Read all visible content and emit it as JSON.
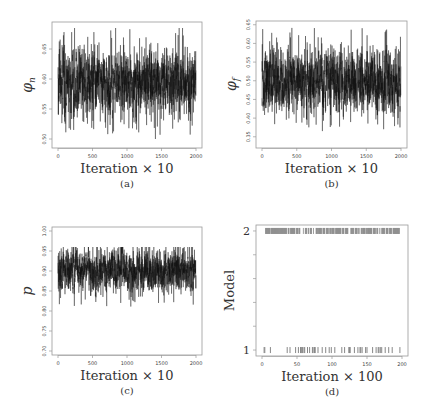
{
  "chart_data": [
    {
      "id": "a",
      "type": "line",
      "title": "",
      "caption": "(a)",
      "xlabel": "Iteration × 10",
      "ylabel": "φ_n",
      "ylabel_main": "φ",
      "ylabel_sub": "n",
      "xlim": [
        0,
        2000
      ],
      "ylim": [
        0.485,
        0.695
      ],
      "xticks": [
        0,
        500,
        1000,
        1500,
        2000
      ],
      "xtick_labels": [
        "0",
        "500",
        "1000",
        "1500",
        "2000"
      ],
      "yticks": [
        0.5,
        0.55,
        0.6,
        0.65
      ],
      "ytick_labels": [
        "0.50",
        "0.55",
        "0.60",
        "0.65"
      ],
      "series": [
        {
          "name": "phi_n trace",
          "mean": 0.595,
          "sd": 0.025,
          "min": 0.5,
          "max": 0.685,
          "n": 2000
        }
      ],
      "grid": false,
      "box": {
        "x": 52,
        "y": 22,
        "w": 150,
        "h": 126
      }
    },
    {
      "id": "b",
      "type": "line",
      "title": "",
      "caption": "(b)",
      "xlabel": "Iteration × 10",
      "ylabel": "φ_f",
      "ylabel_main": "φ",
      "ylabel_sub": "f",
      "xlim": [
        0,
        2000
      ],
      "ylim": [
        0.32,
        0.66
      ],
      "xticks": [
        0,
        500,
        1000,
        1500,
        2000
      ],
      "xtick_labels": [
        "0",
        "500",
        "1000",
        "1500",
        "2000"
      ],
      "yticks": [
        0.35,
        0.4,
        0.45,
        0.5,
        0.55,
        0.6,
        0.65
      ],
      "ytick_labels": [
        "0.35",
        "0.40",
        "0.45",
        "0.50",
        "0.55",
        "0.60",
        "0.65"
      ],
      "series": [
        {
          "name": "phi_f trace",
          "mean": 0.5,
          "sd": 0.04,
          "min": 0.335,
          "max": 0.645,
          "n": 2000
        }
      ],
      "grid": false,
      "box": {
        "x": 256,
        "y": 21,
        "w": 151,
        "h": 127
      }
    },
    {
      "id": "c",
      "type": "line",
      "title": "",
      "caption": "(c)",
      "xlabel": "Iteration × 10",
      "ylabel": "p",
      "ylabel_main": "p",
      "ylabel_sub": "",
      "xlim": [
        0,
        2000
      ],
      "ylim": [
        0.69,
        1.01
      ],
      "xticks": [
        0,
        500,
        1000,
        1500,
        2000
      ],
      "xtick_labels": [
        "0",
        "500",
        "1000",
        "1500",
        "2000"
      ],
      "yticks": [
        0.7,
        0.75,
        0.8,
        0.85,
        0.9,
        0.95,
        1.0
      ],
      "ytick_labels": [
        "0.70",
        "0.75",
        "0.80",
        "0.85",
        "0.90",
        "0.95",
        "1.00"
      ],
      "series": [
        {
          "name": "p trace",
          "mean": 0.9,
          "sd": 0.025,
          "min": 0.785,
          "max": 0.96,
          "n": 2000
        }
      ],
      "grid": false,
      "box": {
        "x": 52,
        "y": 227,
        "w": 150,
        "h": 128
      }
    },
    {
      "id": "d",
      "type": "scatter",
      "title": "",
      "caption": "(d)",
      "xlabel": "Iteration × 100",
      "ylabel": "Model",
      "xlim": [
        0,
        200
      ],
      "ylim": [
        0.95,
        2.05
      ],
      "xticks": [
        0,
        50,
        100,
        150,
        200
      ],
      "xtick_labels": [
        "0",
        "50",
        "100",
        "150",
        "200"
      ],
      "yticks": [
        1,
        1.2,
        1.4,
        1.6,
        1.8,
        2
      ],
      "ytick_labels": [
        "1",
        "",
        "",
        "",
        "",
        "2"
      ],
      "series": [
        {
          "name": "model 1 visits",
          "y": 1,
          "x": [
            3,
            4,
            12,
            36,
            40,
            48,
            52,
            55,
            56,
            57,
            58,
            60,
            61,
            65,
            68,
            72,
            73,
            75,
            76,
            80,
            86,
            91,
            96,
            99,
            104,
            114,
            118,
            124,
            125,
            126,
            132,
            137,
            140,
            141,
            143,
            148,
            150,
            158,
            163,
            166,
            167,
            169,
            171,
            176,
            181,
            186,
            197
          ]
        },
        {
          "name": "model 2 visits",
          "y": 2,
          "x_fill_except_model1": true
        }
      ],
      "grid": false,
      "box": {
        "x": 256,
        "y": 225,
        "w": 152,
        "h": 131
      }
    }
  ],
  "figure": {
    "panels": [
      "(a)",
      "(b)",
      "(c)",
      "(d)"
    ],
    "line_color": "#111111",
    "model_mark_color": "#888888",
    "axis_color": "#999999"
  }
}
